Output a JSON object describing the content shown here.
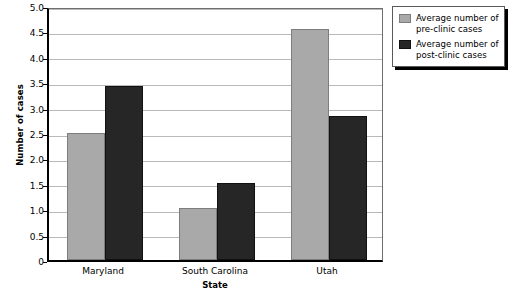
{
  "chart_data": {
    "type": "bar",
    "title": "",
    "xlabel": "State",
    "ylabel": "Number of cases",
    "categories": [
      "Maryland",
      "South Carolina",
      "Utah"
    ],
    "series": [
      {
        "name": "Average number of pre-clinic cases",
        "color": "#a9a9a9",
        "values": [
          2.5,
          1.02,
          4.55
        ]
      },
      {
        "name": "Average number of post-clinic cases",
        "color": "#262626",
        "values": [
          3.42,
          1.52,
          2.83
        ]
      }
    ],
    "ylim": [
      0,
      5.0
    ],
    "ytick_labels": [
      "0",
      "0.5",
      "1.0",
      "1.5",
      "2.0",
      "2.5",
      "3.0",
      "3.5",
      "4.0",
      "4.5",
      "5.0"
    ],
    "ytick_values": [
      0,
      0.5,
      1.0,
      1.5,
      2.0,
      2.5,
      3.0,
      3.5,
      4.0,
      4.5,
      5.0
    ],
    "grid": true,
    "legend_position": "top-right"
  },
  "legend": {
    "entries": [
      {
        "label": "Average number of pre-clinic cases",
        "swatch": "pre"
      },
      {
        "label": "Average number of post-clinic cases",
        "swatch": "post"
      }
    ]
  }
}
